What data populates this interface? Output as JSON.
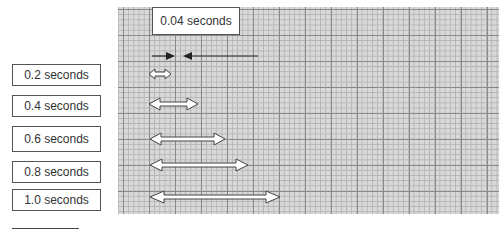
{
  "title_label": "0.04 seconds",
  "labels": [
    {
      "text": "0.2 seconds"
    },
    {
      "text": "0.4 seconds"
    },
    {
      "text": "0.6 seconds"
    },
    {
      "text": "0.8 seconds"
    },
    {
      "text": "1.0 seconds"
    }
  ],
  "grid": {
    "small_square_seconds": 0.04,
    "large_square_seconds": 0.2,
    "background_color": "#d9d9d9",
    "major_line_color": "#8a8a8a",
    "minor_line_color": "#b4b4b4"
  },
  "arrows": [
    {
      "duration": "0.04 seconds",
      "type": "inward-pointers"
    },
    {
      "duration": "0.2 seconds",
      "type": "double-headed"
    },
    {
      "duration": "0.4 seconds",
      "type": "double-headed"
    },
    {
      "duration": "0.6 seconds",
      "type": "double-headed"
    },
    {
      "duration": "0.8 seconds",
      "type": "double-headed"
    },
    {
      "duration": "1.0 seconds",
      "type": "double-headed"
    }
  ]
}
